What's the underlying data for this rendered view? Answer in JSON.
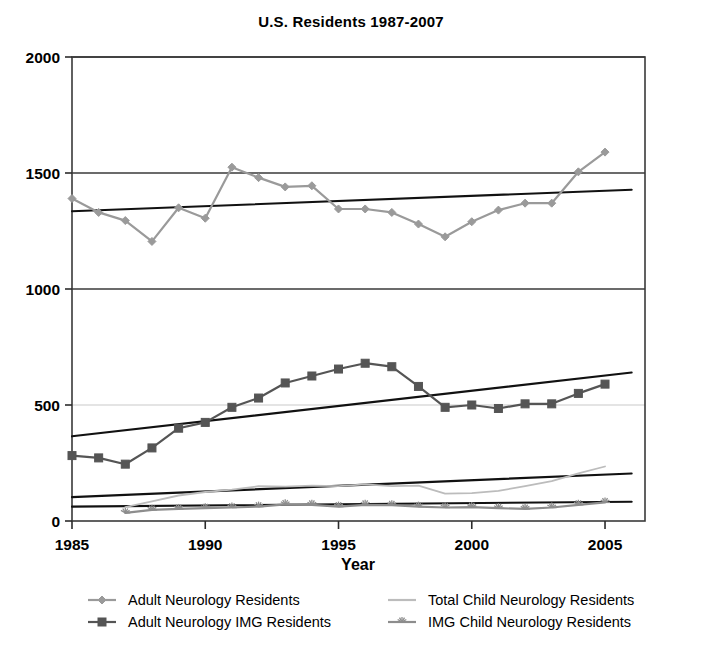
{
  "chart_data": {
    "type": "line",
    "title": "U.S. Residents 1987-2007",
    "xlabel": "Year",
    "ylabel": "",
    "xlim": [
      1985,
      2006.5
    ],
    "ylim": [
      0,
      2000
    ],
    "xticks": [
      1985,
      1990,
      1995,
      2000,
      2005
    ],
    "yticks": [
      0,
      500,
      1000,
      1500,
      2000
    ],
    "grid": "horizontal",
    "legend_position": "bottom",
    "x": [
      1985,
      1986,
      1987,
      1988,
      1989,
      1990,
      1991,
      1992,
      1993,
      1994,
      1995,
      1996,
      1997,
      1998,
      1999,
      2000,
      2001,
      2002,
      2003,
      2004,
      2005
    ],
    "series": [
      {
        "name": "Adult Neurology Residents",
        "color": "#9a9a9a",
        "marker": "diamond",
        "values": [
          1390,
          1330,
          1295,
          1205,
          1350,
          1305,
          1525,
          1480,
          1440,
          1445,
          1345,
          1345,
          1330,
          1280,
          1225,
          1290,
          1340,
          1370,
          1370,
          1505,
          1590
        ],
        "trendline": {
          "x": [
            1985,
            2006
          ],
          "y": [
            1335,
            1428
          ]
        }
      },
      {
        "name": "Adult Neurology IMG Residents",
        "color": "#555555",
        "marker": "square",
        "values": [
          282,
          272,
          245,
          315,
          400,
          425,
          490,
          530,
          595,
          625,
          655,
          680,
          665,
          580,
          490,
          500,
          485,
          505,
          505,
          550,
          590
        ],
        "trendline": {
          "x": [
            1985,
            2006
          ],
          "y": [
            365,
            640
          ]
        }
      },
      {
        "name": "Total Child Neurology Residents",
        "color": "#bcbcbc",
        "marker": "none",
        "values": [
          null,
          null,
          60,
          85,
          110,
          125,
          135,
          150,
          148,
          152,
          150,
          158,
          150,
          152,
          118,
          120,
          130,
          150,
          172,
          205,
          235
        ],
        "trendline": {
          "x": [
            1985,
            2006
          ],
          "y": [
            103,
            205
          ]
        }
      },
      {
        "name": "IMG Child Neurology Residents",
        "color": "#8d8d8d",
        "marker": "star",
        "values": [
          null,
          null,
          35,
          48,
          52,
          55,
          58,
          62,
          72,
          70,
          62,
          70,
          68,
          62,
          58,
          60,
          55,
          52,
          58,
          70,
          80
        ],
        "trendline": {
          "x": [
            1985,
            2006
          ],
          "y": [
            62,
            83
          ]
        }
      }
    ]
  },
  "legend": {
    "entries": [
      {
        "label": "Adult Neurology Residents"
      },
      {
        "label": "Total Child Neurology Residents"
      },
      {
        "label": "Adult Neurology IMG Residents"
      },
      {
        "label": "IMG Child Neurology Residents"
      }
    ]
  },
  "axis": {
    "y_labels": [
      "2000",
      "1500",
      "1000",
      "500",
      "0"
    ],
    "x_labels": [
      "1985",
      "1990",
      "1995",
      "2000",
      "2005"
    ],
    "x_title": "Year"
  }
}
